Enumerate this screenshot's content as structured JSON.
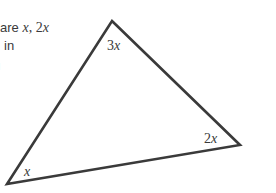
{
  "problem_text": {
    "line1_prefix": "are ",
    "line1_var1": "x",
    "line1_sep": ", 2",
    "line1_var2": "x",
    "line2": "in",
    "line3": "ı"
  },
  "triangle": {
    "stroke_color": "#3a3a3a",
    "vertices": {
      "top": [
        112,
        21
      ],
      "right": [
        240,
        145
      ],
      "bottom_left": [
        7,
        184
      ]
    },
    "angles": {
      "top": {
        "coef": "3",
        "var": "x"
      },
      "right": {
        "coef": "2",
        "var": "x"
      },
      "bottom_left": {
        "coef": "",
        "var": "x"
      }
    }
  }
}
